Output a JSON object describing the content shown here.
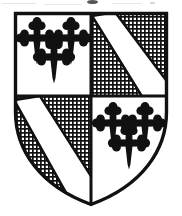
{
  "image": {
    "title": "Quartered heraldic shield (coat of arms)",
    "width": 182,
    "height": 216,
    "background_color": "#ffffff",
    "ink_color": "#111111",
    "style": "black and white line engraving / scanned book plate"
  },
  "shield": {
    "name": "escutcheon",
    "division": "quarterly",
    "outline_color": "#111111",
    "outline_width": 3,
    "field_color": "#ffffff",
    "bounds": {
      "left": 14,
      "top": 12,
      "right": 168,
      "bottom": 206
    },
    "center_point": {
      "x": 91,
      "y": 96
    }
  },
  "quarters": [
    {
      "position": "1st quarter (dexter chief, top left)",
      "charge": "three crosses botonny fitchy",
      "charge_count": 3,
      "charge_color": "#111111",
      "field": "plain",
      "field_color": "#ffffff",
      "arrangement": "two in chief, one in base"
    },
    {
      "position": "2nd quarter (sinister chief, top right)",
      "charge": "bend",
      "charge_count": 1,
      "charge_color": "#ffffff",
      "field": "cross-hatched (fretty / diaper hatching)",
      "field_color": "#111111",
      "bend_direction": "dexter chief to sinister base"
    },
    {
      "position": "3rd quarter (dexter base, bottom left)",
      "charge": "bend",
      "charge_count": 1,
      "charge_color": "#ffffff",
      "field": "cross-hatched (fretty / diaper hatching)",
      "field_color": "#111111",
      "bend_direction": "dexter chief to sinister base"
    },
    {
      "position": "4th quarter (sinister base, bottom right)",
      "charge": "three crosses botonny fitchy",
      "charge_count": 3,
      "charge_color": "#111111",
      "field": "plain",
      "field_color": "#ffffff",
      "arrangement": "two in chief, one in base"
    }
  ],
  "hatching": {
    "pattern": "square grid",
    "cell_size": 4,
    "line_width": 1.6,
    "line_color": "#111111"
  },
  "crosses_q1": [
    {
      "x": 37,
      "y": 38,
      "scale": 1.0,
      "label": "cross-upper-left"
    },
    {
      "x": 71,
      "y": 38,
      "scale": 1.0,
      "label": "cross-upper-right"
    },
    {
      "x": 54,
      "y": 56,
      "scale": 1.0,
      "label": "cross-lower-center"
    }
  ],
  "crosses_q4": [
    {
      "x": 113,
      "y": 123,
      "scale": 1.0,
      "label": "cross-upper-left"
    },
    {
      "x": 144,
      "y": 123,
      "scale": 1.0,
      "label": "cross-upper-right"
    },
    {
      "x": 128,
      "y": 142,
      "scale": 1.0,
      "label": "cross-lower-center"
    }
  ],
  "artifacts": {
    "present": true,
    "description": "faint scanner smudges along the top margin above the shield"
  }
}
